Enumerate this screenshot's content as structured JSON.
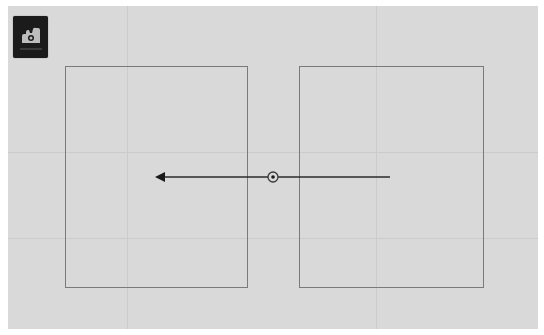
{
  "canvas": {
    "background": "#d9d9d9",
    "grid_color": "#cbcbcb",
    "grid_vertical_x": [
      127,
      376
    ],
    "grid_horizontal_y": [
      152,
      238
    ]
  },
  "toolbar": {
    "active_tool": {
      "icon": "hand-pan-icon",
      "background": "#1b1b1b"
    }
  },
  "frames": [
    {
      "name": "left-frame",
      "x": 65,
      "y": 66,
      "width": 183,
      "height": 222,
      "border_color": "#7a7a7a"
    },
    {
      "name": "right-frame",
      "x": 299,
      "y": 66,
      "width": 185,
      "height": 222,
      "border_color": "#7a7a7a"
    }
  ],
  "drag_gesture": {
    "start": {
      "x": 390,
      "y": 177
    },
    "end": {
      "x": 155,
      "y": 177
    },
    "direction": "left",
    "handle": {
      "x": 273,
      "y": 177
    },
    "line_color": "#2a2a2a"
  }
}
